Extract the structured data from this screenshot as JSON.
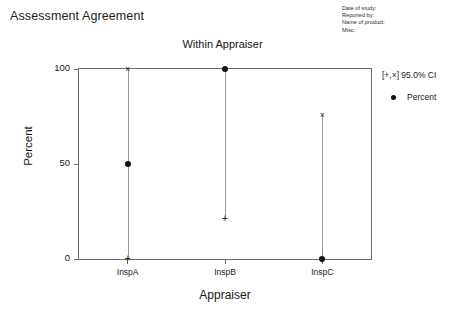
{
  "header": {
    "main_title": "Assessment Agreement",
    "meta": [
      "Date of study:",
      "Reported by:",
      "Name of product:",
      "Misc:"
    ]
  },
  "legend": {
    "ci_label": "[+,×] 95.0% CI",
    "series_label": "Percent",
    "dot_icon": "filled-circle-marker"
  },
  "axes": {
    "y_title": "Percent",
    "x_title": "Appraiser",
    "y_ticks": [
      "0",
      "50",
      "100"
    ],
    "x_ticks": [
      "InspA",
      "InspB",
      "InspC"
    ]
  },
  "colors": {
    "frame": "#6d6d6d",
    "marker": "#111111",
    "ci_line": "#9a9a9a",
    "text": "#1a1a1a",
    "background": "#ffffff"
  },
  "chart_data": {
    "type": "scatter",
    "title": "Within Appraiser",
    "supertitle": "Assessment Agreement",
    "xlabel": "Appraiser",
    "ylabel": "Percent",
    "categories": [
      "InspA",
      "InspB",
      "InspC"
    ],
    "ylim": [
      0,
      100
    ],
    "yticks": [
      0,
      50,
      100
    ],
    "grid": false,
    "legend_position": "right",
    "series": [
      {
        "name": "Percent",
        "marker": "filled-circle",
        "values": [
          50,
          100,
          0
        ]
      },
      {
        "name": "95.0% CI lower",
        "marker": "plus",
        "values": [
          0,
          21,
          0
        ]
      },
      {
        "name": "95.0% CI upper",
        "marker": "cross",
        "values": [
          100,
          100,
          76
        ]
      }
    ],
    "points": [
      {
        "category": "InspA",
        "percent": 50,
        "ci_lower": 0,
        "ci_upper": 100
      },
      {
        "category": "InspB",
        "percent": 100,
        "ci_lower": 21,
        "ci_upper": 100
      },
      {
        "category": "InspC",
        "percent": 0,
        "ci_lower": 0,
        "ci_upper": 76
      }
    ],
    "annotations": [
      "[+,×] 95.0% CI",
      "Percent"
    ]
  }
}
